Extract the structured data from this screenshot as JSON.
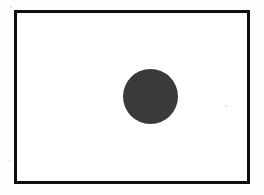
{
  "page": {
    "background_color": "#fdfdfd",
    "width": 264,
    "height": 195
  },
  "frame": {
    "name": "rectangle-border",
    "stroke_color": "#100f0f",
    "fill_color": "#ffffff",
    "stroke_width_px": 3,
    "left_px": 14,
    "top_px": 10,
    "width_px": 236,
    "height_px": 174
  },
  "shape": {
    "name": "filled-circle",
    "kind": "circle",
    "fill_color": "#3b3a3a",
    "center_x_px": 150,
    "center_y_px": 96,
    "diameter_px": 55,
    "radius_px": 27
  },
  "artifacts": {
    "speckles": [
      {
        "name": "speckle-right",
        "x_px": 225,
        "y_px": 105,
        "color": "#c9c9c9"
      },
      {
        "name": "speckle-left",
        "x_px": 9,
        "y_px": 160,
        "color": "#c9c9c9"
      },
      {
        "name": "speckle-top",
        "x_px": 10,
        "y_px": 6,
        "color": "#c9c9c9"
      }
    ]
  },
  "labels": {
    "title": "",
    "caption": "",
    "annotations": []
  }
}
